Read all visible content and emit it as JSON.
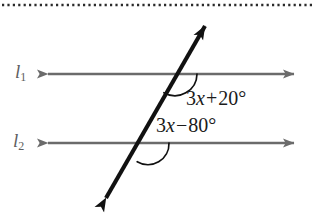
{
  "figure": {
    "type": "geometry-diagram",
    "background_color": "#ffffff",
    "parallel_line_color": "#6b6b6b",
    "transversal_color": "#111111",
    "label_color": "#5e5e5e",
    "expression_color": "#1b1b1b",
    "top_border": {
      "name": "dotted-rule",
      "style": "dotted",
      "color": "#2b2b2b"
    },
    "lines": [
      {
        "id": "l1",
        "name": "l",
        "subscript": "1",
        "kind": "parallel-line",
        "arrowheads": "both"
      },
      {
        "id": "l2",
        "name": "l",
        "subscript": "2",
        "kind": "parallel-line",
        "arrowheads": "both"
      }
    ],
    "transversal": {
      "id": "t",
      "kind": "transversal",
      "arrowheads": "both"
    },
    "angles": [
      {
        "id": "angle-top",
        "at_line": "l1",
        "coefficient": "3",
        "variable": "x",
        "operator": "+",
        "constant": "20",
        "degree_symbol": "°",
        "expression": "3x + 20°"
      },
      {
        "id": "angle-bottom",
        "at_line": "l2",
        "coefficient": "3",
        "variable": "x",
        "operator": "−",
        "constant": "80",
        "degree_symbol": "°",
        "expression": "3x − 80°"
      }
    ]
  }
}
